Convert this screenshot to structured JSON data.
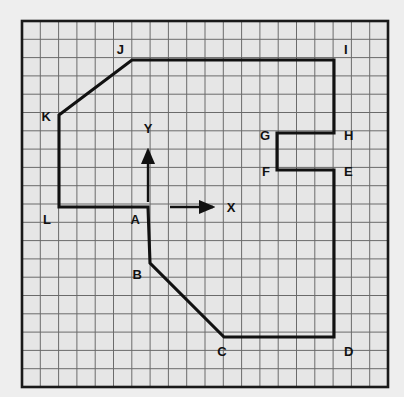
{
  "figure": {
    "background_color": "#eeeeee",
    "paper_color": "#e6e6e6",
    "grid_line_color": "#6b6b6b",
    "border_color": "#1a1a1a",
    "polygon_color": "#111111",
    "label_color": "#111111"
  },
  "grid": {
    "columns": 20,
    "rows": 20,
    "cell_size_px": 18.3,
    "origin_px": {
      "x": 22,
      "y": 21
    },
    "grid_on": true
  },
  "axes": {
    "x_axis": {
      "label": "X",
      "label_pos_px": {
        "x": 231,
        "y": 212
      },
      "arrow_from_px": {
        "x": 170,
        "y": 207
      },
      "arrow_to_px": {
        "x": 213,
        "y": 207
      }
    },
    "y_axis": {
      "label": "Y",
      "label_pos_px": {
        "x": 148,
        "y": 133
      },
      "arrow_from_px": {
        "x": 148,
        "y": 202
      },
      "arrow_to_px": {
        "x": 148,
        "y": 150
      }
    },
    "origin_label": "A"
  },
  "chart_data": {
    "type": "scatter",
    "xlabel": "X",
    "ylabel": "Y",
    "grid": true,
    "legend": "none",
    "xlim": [
      -7,
      13
    ],
    "ylim": [
      -7,
      13
    ],
    "vertices": [
      {
        "name": "A",
        "grid": [
          0,
          0
        ],
        "px": [
          148,
          207
        ],
        "label_px": [
          140,
          224
        ],
        "label_anchor": "end"
      },
      {
        "name": "B",
        "grid": [
          0,
          -3
        ],
        "px": [
          150,
          263
        ],
        "label_px": [
          142,
          279
        ],
        "label_anchor": "end"
      },
      {
        "name": "C",
        "grid": [
          4,
          -7
        ],
        "px": [
          224,
          337
        ],
        "label_px": [
          222,
          356
        ],
        "label_anchor": "middle"
      },
      {
        "name": "D",
        "grid": [
          10,
          -7
        ],
        "px": [
          334,
          337
        ],
        "label_px": [
          344,
          356
        ],
        "label_anchor": "start"
      },
      {
        "name": "E",
        "grid": [
          10,
          2
        ],
        "px": [
          334,
          170
        ],
        "label_px": [
          344,
          176
        ],
        "label_anchor": "start"
      },
      {
        "name": "F",
        "grid": [
          7,
          2
        ],
        "px": [
          277,
          170
        ],
        "label_px": [
          270,
          176
        ],
        "label_anchor": "end"
      },
      {
        "name": "G",
        "grid": [
          7,
          4
        ],
        "px": [
          277,
          133
        ],
        "label_px": [
          270,
          140
        ],
        "label_anchor": "end"
      },
      {
        "name": "H",
        "grid": [
          10,
          4
        ],
        "px": [
          334,
          133
        ],
        "label_px": [
          344,
          140
        ],
        "label_anchor": "start"
      },
      {
        "name": "I",
        "grid": [
          10,
          8
        ],
        "px": [
          334,
          60
        ],
        "label_px": [
          344,
          54
        ],
        "label_anchor": "start"
      },
      {
        "name": "J",
        "grid": [
          -1,
          8
        ],
        "px": [
          132,
          60
        ],
        "label_px": [
          124,
          54
        ],
        "label_anchor": "end"
      },
      {
        "name": "K",
        "grid": [
          -4,
          5
        ],
        "px": [
          59,
          115
        ],
        "label_px": [
          51,
          121
        ],
        "label_anchor": "end"
      },
      {
        "name": "L",
        "grid": [
          -4,
          0
        ],
        "px": [
          59,
          207
        ],
        "label_px": [
          51,
          224
        ],
        "label_anchor": "end"
      }
    ],
    "edges": [
      [
        "A",
        "B"
      ],
      [
        "B",
        "C"
      ],
      [
        "C",
        "D"
      ],
      [
        "D",
        "E"
      ],
      [
        "E",
        "F"
      ],
      [
        "F",
        "G"
      ],
      [
        "G",
        "H"
      ],
      [
        "H",
        "I"
      ],
      [
        "I",
        "J"
      ],
      [
        "J",
        "K"
      ],
      [
        "K",
        "L"
      ],
      [
        "L",
        "A"
      ]
    ]
  }
}
